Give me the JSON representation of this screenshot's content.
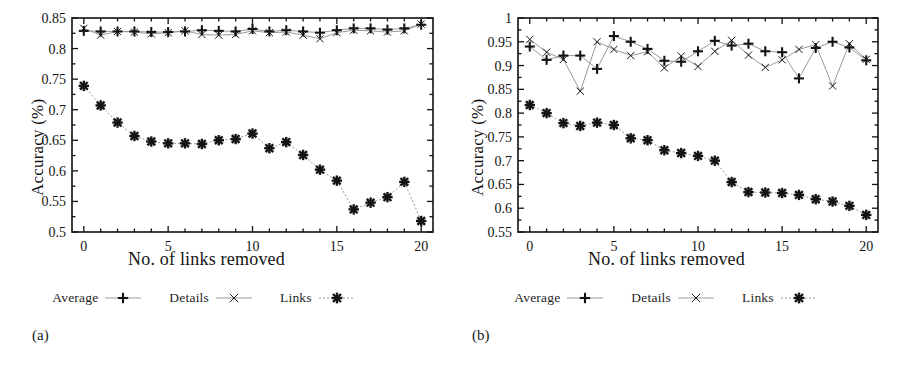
{
  "figure": {
    "panels": [
      {
        "caption": "(a)",
        "axis": {
          "ylabel": "Accuracy (%)",
          "xlabel": "No. of links removed",
          "yticks": [
            "0.5",
            "0.55",
            "0.6",
            "0.65",
            "0.7",
            "0.75",
            "0.8",
            "0.85"
          ],
          "xticks": [
            "0",
            "5",
            "10",
            "15",
            "20"
          ]
        },
        "legend": [
          {
            "label": "Average",
            "marker": "plus-marker"
          },
          {
            "label": "Details",
            "marker": "x-marker"
          },
          {
            "label": "Links",
            "marker": "star-marker"
          }
        ]
      },
      {
        "caption": "(b)",
        "axis": {
          "ylabel": "Accuracy (%)",
          "xlabel": "No. of links removed",
          "yticks": [
            "0.55",
            "0.6",
            "0.65",
            "0.7",
            "0.75",
            "0.8",
            "0.85",
            "0.9",
            "0.95",
            "1"
          ],
          "xticks": [
            "0",
            "5",
            "10",
            "15",
            "20"
          ]
        },
        "legend": [
          {
            "label": "Average",
            "marker": "plus-marker"
          },
          {
            "label": "Details",
            "marker": "x-marker"
          },
          {
            "label": "Links",
            "marker": "star-marker"
          }
        ]
      }
    ]
  },
  "chart_data": [
    {
      "type": "line",
      "panel": "(a)",
      "title": "",
      "xlabel": "No. of links removed",
      "ylabel": "Accuracy (%)",
      "xlim": [
        -0.7,
        20.7
      ],
      "ylim": [
        0.5,
        0.85
      ],
      "xticks": [
        0,
        5,
        10,
        15,
        20
      ],
      "yticks": [
        0.5,
        0.55,
        0.6,
        0.65,
        0.7,
        0.75,
        0.8,
        0.85
      ],
      "grid": false,
      "legend_position": "below",
      "x": [
        0,
        1,
        2,
        3,
        4,
        5,
        6,
        7,
        8,
        9,
        10,
        11,
        12,
        13,
        14,
        15,
        16,
        17,
        18,
        19,
        20
      ],
      "series": [
        {
          "name": "Average",
          "marker": "plus",
          "values": [
            0.829,
            0.828,
            0.828,
            0.828,
            0.827,
            0.827,
            0.828,
            0.83,
            0.829,
            0.828,
            0.832,
            0.828,
            0.83,
            0.828,
            0.826,
            0.83,
            0.833,
            0.833,
            0.831,
            0.833,
            0.839
          ]
        },
        {
          "name": "Details",
          "marker": "x",
          "values": [
            0.833,
            0.822,
            0.828,
            0.827,
            0.824,
            0.826,
            0.829,
            0.823,
            0.822,
            0.823,
            0.829,
            0.826,
            0.827,
            0.822,
            0.816,
            0.826,
            0.83,
            0.829,
            0.827,
            0.829,
            0.84
          ]
        },
        {
          "name": "Links",
          "marker": "star",
          "values": [
            0.739,
            0.707,
            0.679,
            0.657,
            0.648,
            0.645,
            0.645,
            0.644,
            0.65,
            0.652,
            0.661,
            0.637,
            0.647,
            0.626,
            0.602,
            0.584,
            0.537,
            0.548,
            0.557,
            0.582,
            0.518
          ]
        }
      ]
    },
    {
      "type": "line",
      "panel": "(b)",
      "title": "",
      "xlabel": "No. of links removed",
      "ylabel": "Accuracy (%)",
      "xlim": [
        -0.7,
        20.7
      ],
      "ylim": [
        0.55,
        1.0
      ],
      "xticks": [
        0,
        5,
        10,
        15,
        20
      ],
      "yticks": [
        0.55,
        0.6,
        0.65,
        0.7,
        0.75,
        0.8,
        0.85,
        0.9,
        0.95,
        1.0
      ],
      "grid": false,
      "legend_position": "below",
      "x": [
        0,
        1,
        2,
        3,
        4,
        5,
        6,
        7,
        8,
        9,
        10,
        11,
        12,
        13,
        14,
        15,
        16,
        17,
        18,
        19,
        20
      ],
      "series": [
        {
          "name": "Average",
          "marker": "plus",
          "values": [
            0.94,
            0.912,
            0.921,
            0.921,
            0.893,
            0.962,
            0.95,
            0.935,
            0.91,
            0.908,
            0.93,
            0.952,
            0.942,
            0.946,
            0.93,
            0.928,
            0.873,
            0.937,
            0.95,
            0.938,
            0.911
          ]
        },
        {
          "name": "Details",
          "marker": "x",
          "values": [
            0.955,
            0.928,
            0.913,
            0.846,
            0.95,
            0.934,
            0.921,
            0.929,
            0.895,
            0.92,
            0.898,
            0.93,
            0.953,
            0.922,
            0.896,
            0.912,
            0.934,
            0.944,
            0.857,
            0.946,
            0.913
          ]
        },
        {
          "name": "Links",
          "marker": "star",
          "values": [
            0.817,
            0.8,
            0.779,
            0.773,
            0.78,
            0.775,
            0.747,
            0.743,
            0.722,
            0.716,
            0.71,
            0.7,
            0.655,
            0.634,
            0.633,
            0.632,
            0.628,
            0.619,
            0.614,
            0.605,
            0.586
          ]
        }
      ]
    }
  ]
}
